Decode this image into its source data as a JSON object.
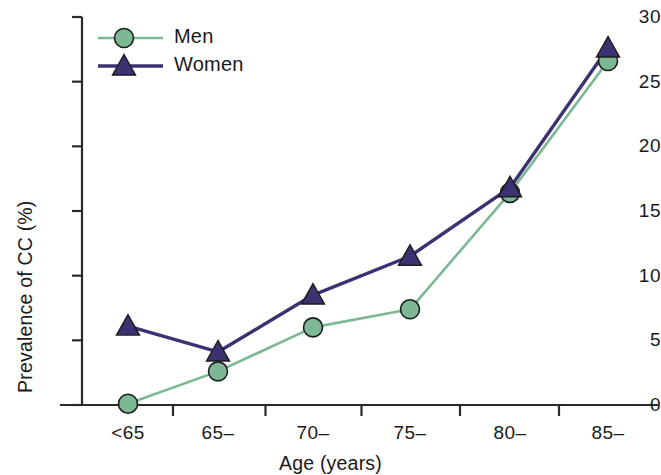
{
  "chart_data": {
    "type": "line",
    "title": "",
    "subtitle": "",
    "xlabel": "Age (years)",
    "ylabel": "Prevalence of CC (%)",
    "categories": [
      "<65",
      "65–",
      "70–",
      "75–",
      "80–",
      "85–"
    ],
    "xtick_labels": [
      "<65",
      "65–",
      "70–",
      "75–",
      "80–",
      "85–"
    ],
    "ytick_labels": [
      "0",
      "5",
      "10",
      "15",
      "20",
      "25",
      "30"
    ],
    "ytick_values": [
      0,
      5,
      10,
      15,
      20,
      25,
      30
    ],
    "ylim": [
      0,
      30
    ],
    "grid": false,
    "legend_position": "top-left",
    "series": [
      {
        "name": "Men",
        "color": "#7cb894",
        "marker": "circle",
        "values": [
          0.1,
          2.6,
          6.0,
          7.4,
          16.4,
          26.6
        ]
      },
      {
        "name": "Women",
        "color": "#3b3272",
        "marker": "triangle",
        "values": [
          6.1,
          4.1,
          8.5,
          11.5,
          16.8,
          27.6
        ]
      }
    ]
  },
  "axes": {
    "axis_line_color": "#2a2a2a"
  }
}
